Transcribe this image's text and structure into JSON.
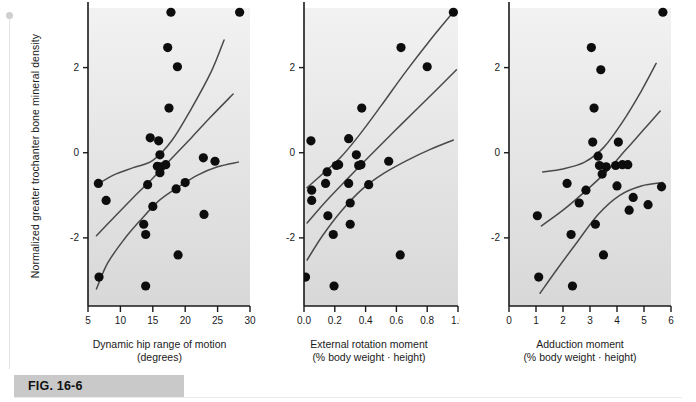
{
  "figure": {
    "caption": "FIG. 16-6",
    "y_axis_label": "Normalized greater trochanter bone mineral density",
    "marker_color": "#0d0d0d",
    "curve_color": "#4a4a4a",
    "axis_color": "#1a1a1a",
    "plot_bg_top": "#f2f2f2",
    "plot_bg_bottom": "#d8d8d8"
  },
  "chart_data": [
    {
      "type": "scatter",
      "panel": 1,
      "title": "",
      "xlabel": "Dynamic hip range of motion",
      "xlabel_units": "(degrees)",
      "ylabel": "Normalized greater trochanter bone mineral density",
      "xlim": [
        5,
        30
      ],
      "ylim": [
        -3.6,
        3.4
      ],
      "xticks": [
        5,
        10,
        15,
        20,
        25,
        30
      ],
      "xticklabels": [
        "5",
        "10",
        "15",
        "20",
        "25",
        "30"
      ],
      "yticks": [
        2,
        0,
        -2
      ],
      "yticklabels": [
        "2",
        "0",
        "-2"
      ],
      "grid": false,
      "legend": "none",
      "points": [
        [
          6.6,
          -0.72
        ],
        [
          7.8,
          -1.12
        ],
        [
          6.7,
          -2.92
        ],
        [
          13.6,
          -1.68
        ],
        [
          13.9,
          -1.92
        ],
        [
          13.9,
          -3.13
        ],
        [
          14.2,
          -0.75
        ],
        [
          14.6,
          0.35
        ],
        [
          15.0,
          -1.26
        ],
        [
          15.7,
          -0.32
        ],
        [
          15.9,
          0.28
        ],
        [
          16.1,
          -0.05
        ],
        [
          16.1,
          -0.47
        ],
        [
          16.3,
          -0.33
        ],
        [
          17.0,
          -0.28
        ],
        [
          17.3,
          2.47
        ],
        [
          17.5,
          1.05
        ],
        [
          17.8,
          3.3
        ],
        [
          18.6,
          -0.85
        ],
        [
          18.8,
          2.02
        ],
        [
          18.9,
          -2.4
        ],
        [
          20.0,
          -0.7
        ],
        [
          22.8,
          -0.12
        ],
        [
          22.9,
          -1.45
        ],
        [
          24.6,
          -0.2
        ],
        [
          28.4,
          3.3
        ]
      ],
      "curves": [
        {
          "name": "upper-confidence-band",
          "points": [
            [
              6.4,
              -0.75
            ],
            [
              9,
              -0.52
            ],
            [
              12,
              -0.35
            ],
            [
              15,
              -0.18
            ],
            [
              18,
              0.3
            ],
            [
              21,
              1.05
            ],
            [
              24,
              1.9
            ],
            [
              26,
              2.65
            ]
          ]
        },
        {
          "name": "regression-line",
          "points": [
            [
              6.3,
              -1.95
            ],
            [
              9,
              -1.52
            ],
            [
              12,
              -1.05
            ],
            [
              15,
              -0.6
            ],
            [
              18,
              -0.12
            ],
            [
              21,
              0.36
            ],
            [
              24,
              0.85
            ],
            [
              27.4,
              1.38
            ]
          ]
        },
        {
          "name": "lower-confidence-band",
          "points": [
            [
              6.3,
              -3.2
            ],
            [
              8,
              -2.6
            ],
            [
              10.5,
              -2.05
            ],
            [
              13,
              -1.6
            ],
            [
              16,
              -1.12
            ],
            [
              19,
              -0.8
            ],
            [
              22,
              -0.52
            ],
            [
              25,
              -0.33
            ],
            [
              28.2,
              -0.22
            ]
          ]
        }
      ]
    },
    {
      "type": "scatter",
      "panel": 2,
      "title": "",
      "xlabel": "External rotation moment",
      "xlabel_units": "(% body weight · height)",
      "ylabel": "Normalized greater trochanter bone mineral density",
      "xlim": [
        0.0,
        1.0
      ],
      "ylim": [
        -3.6,
        3.4
      ],
      "xticks": [
        0.0,
        0.2,
        0.4,
        0.6,
        0.8,
        1.0
      ],
      "xticklabels": [
        "0.0",
        "0.2",
        "0.4",
        "0.6",
        "0.8",
        "1.0"
      ],
      "yticks": [
        2,
        0,
        -2
      ],
      "yticklabels": [
        "2",
        "0",
        "-2"
      ],
      "grid": false,
      "legend": "none",
      "points": [
        [
          0.01,
          -2.92
        ],
        [
          0.045,
          0.28
        ],
        [
          0.05,
          -0.88
        ],
        [
          0.05,
          -1.12
        ],
        [
          0.14,
          -0.72
        ],
        [
          0.15,
          -0.45
        ],
        [
          0.155,
          -1.48
        ],
        [
          0.19,
          -1.92
        ],
        [
          0.195,
          -3.13
        ],
        [
          0.21,
          -0.3
        ],
        [
          0.225,
          -0.28
        ],
        [
          0.29,
          0.33
        ],
        [
          0.29,
          -0.72
        ],
        [
          0.3,
          -1.18
        ],
        [
          0.3,
          -1.68
        ],
        [
          0.34,
          -0.05
        ],
        [
          0.355,
          -0.3
        ],
        [
          0.37,
          -0.28
        ],
        [
          0.375,
          1.05
        ],
        [
          0.42,
          -0.75
        ],
        [
          0.55,
          -0.2
        ],
        [
          0.625,
          -2.4
        ],
        [
          0.63,
          2.47
        ],
        [
          0.8,
          2.02
        ],
        [
          0.97,
          3.3
        ]
      ],
      "curves": [
        {
          "name": "upper-confidence-band",
          "points": [
            [
              0.02,
              -0.82
            ],
            [
              0.12,
              -0.5
            ],
            [
              0.24,
              -0.1
            ],
            [
              0.36,
              0.42
            ],
            [
              0.5,
              1.1
            ],
            [
              0.66,
              1.9
            ],
            [
              0.82,
              2.65
            ],
            [
              0.98,
              3.35
            ]
          ]
        },
        {
          "name": "regression-line",
          "points": [
            [
              0.02,
              -1.65
            ],
            [
              0.14,
              -1.15
            ],
            [
              0.28,
              -0.62
            ],
            [
              0.42,
              -0.1
            ],
            [
              0.58,
              0.48
            ],
            [
              0.74,
              1.05
            ],
            [
              0.88,
              1.55
            ],
            [
              0.99,
              1.95
            ]
          ]
        },
        {
          "name": "lower-confidence-band",
          "points": [
            [
              0.02,
              -2.52
            ],
            [
              0.12,
              -1.95
            ],
            [
              0.24,
              -1.38
            ],
            [
              0.38,
              -0.85
            ],
            [
              0.52,
              -0.48
            ],
            [
              0.68,
              -0.16
            ],
            [
              0.82,
              0.08
            ],
            [
              0.97,
              0.3
            ]
          ]
        }
      ]
    },
    {
      "type": "scatter",
      "panel": 3,
      "title": "",
      "xlabel": "Adduction moment",
      "xlabel_units": "(% body weight · height)",
      "ylabel": "Normalized greater trochanter bone mineral density",
      "xlim": [
        0,
        6
      ],
      "ylim": [
        -3.6,
        3.4
      ],
      "xticks": [
        0,
        1,
        2,
        3,
        4,
        5,
        6
      ],
      "xticklabels": [
        "0",
        "1",
        "2",
        "3",
        "4",
        "5",
        "6"
      ],
      "yticks": [
        2,
        0,
        -2
      ],
      "yticklabels": [
        "2",
        "0",
        "-2"
      ],
      "grid": false,
      "legend": "none",
      "points": [
        [
          1.05,
          -1.48
        ],
        [
          1.1,
          -2.92
        ],
        [
          2.15,
          -0.72
        ],
        [
          2.3,
          -1.92
        ],
        [
          2.35,
          -3.13
        ],
        [
          2.6,
          -1.18
        ],
        [
          2.85,
          -0.88
        ],
        [
          3.05,
          2.47
        ],
        [
          3.1,
          0.25
        ],
        [
          3.15,
          1.05
        ],
        [
          3.2,
          -1.68
        ],
        [
          3.3,
          -0.08
        ],
        [
          3.35,
          -0.3
        ],
        [
          3.4,
          1.95
        ],
        [
          3.45,
          -0.5
        ],
        [
          3.5,
          -2.4
        ],
        [
          3.6,
          -0.33
        ],
        [
          3.95,
          -0.3
        ],
        [
          4.0,
          -0.78
        ],
        [
          4.05,
          0.25
        ],
        [
          4.2,
          -0.28
        ],
        [
          4.4,
          -0.28
        ],
        [
          4.45,
          -1.35
        ],
        [
          4.6,
          -1.05
        ],
        [
          5.15,
          -1.22
        ],
        [
          5.65,
          -0.8
        ],
        [
          5.7,
          3.3
        ]
      ],
      "curves": [
        {
          "name": "upper-confidence-band",
          "points": [
            [
              1.25,
              -0.45
            ],
            [
              2.0,
              -0.38
            ],
            [
              2.8,
              -0.22
            ],
            [
              3.5,
              0.12
            ],
            [
              4.2,
              0.72
            ],
            [
              4.9,
              1.45
            ],
            [
              5.45,
              2.1
            ]
          ]
        },
        {
          "name": "regression-line",
          "points": [
            [
              1.2,
              -1.72
            ],
            [
              2.0,
              -1.35
            ],
            [
              2.8,
              -0.92
            ],
            [
              3.6,
              -0.45
            ],
            [
              4.3,
              0.05
            ],
            [
              5.0,
              0.55
            ],
            [
              5.6,
              0.98
            ]
          ]
        },
        {
          "name": "lower-confidence-band",
          "points": [
            [
              1.15,
              -3.3
            ],
            [
              1.8,
              -2.72
            ],
            [
              2.5,
              -2.12
            ],
            [
              3.3,
              -1.45
            ],
            [
              4.1,
              -1.0
            ],
            [
              4.9,
              -0.78
            ],
            [
              5.7,
              -0.7
            ]
          ]
        }
      ]
    }
  ],
  "panels": [
    {
      "id": "panel-1",
      "xlabel_line1": "Dynamic hip range of motion",
      "xlabel_line2": "(degrees)"
    },
    {
      "id": "panel-2",
      "xlabel_line1": "External rotation moment",
      "xlabel_line2": "(% body weight · height)"
    },
    {
      "id": "panel-3",
      "xlabel_line1": "Adduction moment",
      "xlabel_line2": "(% body weight · height)"
    }
  ]
}
